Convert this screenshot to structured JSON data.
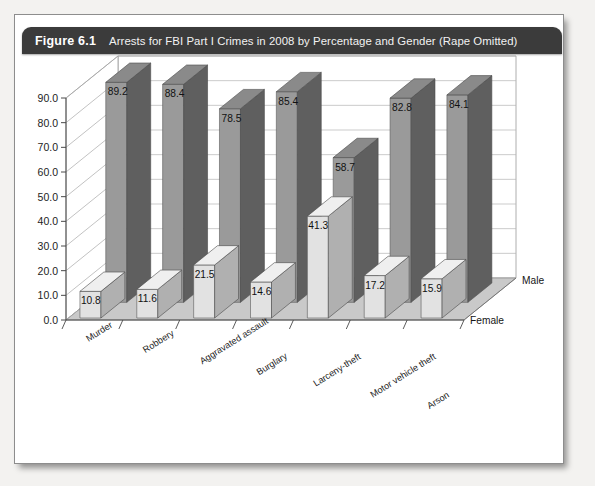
{
  "figure": {
    "number": "Figure 6.1",
    "title": "Arrests for FBI Part I Crimes in 2008 by Percentage and Gender (Rape Omitted)",
    "header_color": "#3b3b3b"
  },
  "chart_data": {
    "type": "bar",
    "title": "Arrests for FBI Part I Crimes in 2008 by Percentage and Gender (Rape Omitted)",
    "xlabel": "",
    "ylabel": "",
    "ylim": [
      0,
      90
    ],
    "yticks": [
      "0.0",
      "10.0",
      "20.0",
      "30.0",
      "40.0",
      "50.0",
      "60.0",
      "70.0",
      "80.0",
      "90.0"
    ],
    "grid": true,
    "legend_position": "depth-axis-right",
    "depth_axis_labels": [
      "Male",
      "Female"
    ],
    "categories": [
      "Murder",
      "Robbery",
      "Aggravated assault",
      "Burglary",
      "Larceny-theft",
      "Motor vehicle theft",
      "Arson"
    ],
    "series": [
      {
        "name": "Male",
        "color": "#9a9a9a",
        "values": [
          89.2,
          88.4,
          78.5,
          85.4,
          58.7,
          82.8,
          84.1
        ],
        "labels": [
          "89.2",
          "88.4",
          "78.5",
          "85.4",
          "58.7",
          "82.8",
          "84.1"
        ]
      },
      {
        "name": "Female",
        "color": "#e2e2e2",
        "values": [
          10.8,
          11.6,
          21.5,
          14.6,
          41.3,
          17.2,
          15.9
        ],
        "labels": [
          "10.8",
          "11.6",
          "21.5",
          "14.6",
          "41.3",
          "17.2",
          "15.9"
        ]
      }
    ]
  }
}
